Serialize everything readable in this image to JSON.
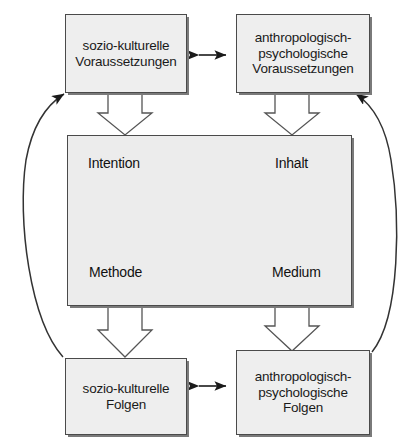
{
  "diagram": {
    "background_color": "#ffffff",
    "box_fill_color": "#eeeeee",
    "box_border_color": "#4a4a4a",
    "line_color": "#1a1a1a",
    "nodes": {
      "top_left": {
        "id": "sozio-kulturelle-voraussetzungen",
        "line1": "sozio-kulturelle",
        "line2": "Voraussetzungen"
      },
      "top_right": {
        "id": "anthropologisch-psychologische-voraussetzungen",
        "line1": "anthropologisch-",
        "line2": "psychologische",
        "line3": "Voraussetzungen"
      },
      "bottom_left": {
        "id": "sozio-kulturelle-folgen",
        "line1": "sozio-kulturelle",
        "line2": "Folgen"
      },
      "bottom_right": {
        "id": "anthropologisch-psychologische-folgen",
        "line1": "anthropologisch-",
        "line2": "psychologische",
        "line3": "Folgen"
      },
      "center": {
        "id": "entscheidungsfelder",
        "intention": "Intention",
        "inhalt": "Inhalt",
        "methode": "Methode",
        "medium": "Medium"
      }
    },
    "connections": [
      {
        "from": "sozio-kulturelle Voraussetzungen",
        "to": "anthropologisch-psychologische Voraussetzungen",
        "style": "double-arrow-thin"
      },
      {
        "from": "sozio-kulturelle Folgen",
        "to": "anthropologisch-psychologische Folgen",
        "style": "double-arrow-thin"
      },
      {
        "from": "sozio-kulturelle Voraussetzungen",
        "to": "Entscheidungsfelder",
        "style": "hollow-block-arrow-down"
      },
      {
        "from": "anthropologisch-psychologische Voraussetzungen",
        "to": "Entscheidungsfelder",
        "style": "hollow-block-arrow-down"
      },
      {
        "from": "Entscheidungsfelder",
        "to": "sozio-kulturelle Folgen",
        "style": "hollow-block-arrow-down"
      },
      {
        "from": "Entscheidungsfelder",
        "to": "anthropologisch-psychologische Folgen",
        "style": "hollow-block-arrow-down"
      },
      {
        "from": "sozio-kulturelle Folgen",
        "to": "sozio-kulturelle Voraussetzungen",
        "style": "curved-feedback-arrow-left"
      },
      {
        "from": "anthropologisch-psychologische Folgen",
        "to": "anthropologisch-psychologische Voraussetzungen",
        "style": "curved-feedback-arrow-right"
      },
      {
        "from": "Intention",
        "to": "Inhalt",
        "style": "double-arrow"
      },
      {
        "from": "Methode",
        "to": "Medium",
        "style": "double-arrow"
      },
      {
        "from": "Intention",
        "to": "Methode",
        "style": "double-arrow"
      },
      {
        "from": "Inhalt",
        "to": "Medium",
        "style": "double-arrow"
      },
      {
        "from": "Intention",
        "to": "Medium",
        "style": "double-arrow-diagonal"
      },
      {
        "from": "Inhalt",
        "to": "Methode",
        "style": "double-arrow-diagonal"
      }
    ]
  }
}
